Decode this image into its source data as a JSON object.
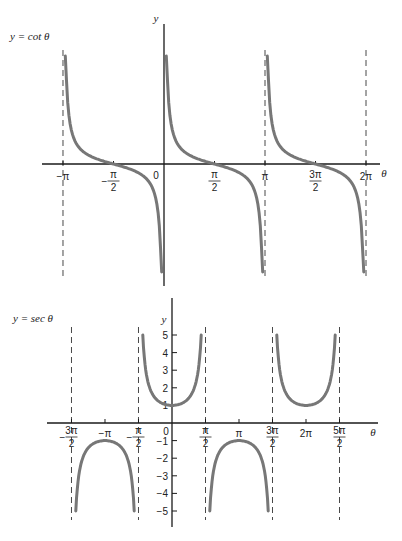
{
  "chart_data": [
    {
      "type": "line",
      "title": "y = cot θ",
      "function": "cot",
      "xlabel": "θ",
      "ylabel": "y",
      "x_ticks": [
        "−π",
        "−π/2",
        "0",
        "π/2",
        "π",
        "3π/2",
        "2π"
      ],
      "x_tick_values": [
        -3.1416,
        -1.5708,
        0,
        1.5708,
        3.1416,
        4.7124,
        6.2832
      ],
      "asymptotes": [
        "−π",
        "0",
        "π",
        "2π"
      ],
      "asymptote_values": [
        -3.1416,
        0,
        3.1416,
        6.2832
      ],
      "zeros": [
        "−π/2",
        "π/2",
        "3π/2"
      ],
      "branches": [
        {
          "x_range": [
            -3.1416,
            0
          ]
        },
        {
          "x_range": [
            0,
            3.1416
          ]
        },
        {
          "x_range": [
            3.1416,
            6.2832
          ]
        }
      ],
      "grid": false
    },
    {
      "type": "line",
      "title": "y = sec θ",
      "function": "sec",
      "xlabel": "θ",
      "ylabel": "y",
      "x_ticks": [
        "−3π/2",
        "−π",
        "−π/2",
        "0",
        "π/2",
        "π",
        "3π/2",
        "2π",
        "5π/2"
      ],
      "x_tick_values": [
        -4.7124,
        -3.1416,
        -1.5708,
        0,
        1.5708,
        3.1416,
        4.7124,
        6.2832,
        7.854
      ],
      "y_ticks": [
        5,
        4,
        3,
        2,
        1,
        -1,
        -2,
        -3,
        -4,
        -5
      ],
      "ylim": [
        -5,
        5
      ],
      "asymptotes": [
        "−3π/2",
        "−π/2",
        "π/2",
        "3π/2",
        "5π/2"
      ],
      "asymptote_values": [
        -4.7124,
        -1.5708,
        1.5708,
        4.7124,
        7.854
      ],
      "branches": [
        {
          "x_range": [
            -4.7124,
            -1.5708
          ],
          "extremum": {
            "x": -3.1416,
            "y": -1
          }
        },
        {
          "x_range": [
            -1.5708,
            1.5708
          ],
          "extremum": {
            "x": 0,
            "y": 1
          }
        },
        {
          "x_range": [
            1.5708,
            4.7124
          ],
          "extremum": {
            "x": 3.1416,
            "y": -1
          }
        },
        {
          "x_range": [
            4.7124,
            7.854
          ],
          "extremum": {
            "x": 6.2832,
            "y": 1
          }
        }
      ],
      "grid": false
    }
  ],
  "labels": {
    "top_title": "y = cot θ",
    "bottom_title": "y = sec θ",
    "y_axis": "y",
    "x_axis": "θ",
    "zero": "0"
  }
}
